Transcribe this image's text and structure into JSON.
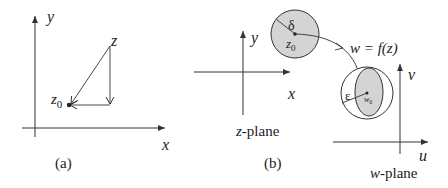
{
  "panel_a": {
    "caption": "(a)",
    "axis_x": "x",
    "axis_y": "y",
    "point_z": "z",
    "point_z0_main": "z",
    "point_z0_sub": "0"
  },
  "panel_b": {
    "caption": "(b)",
    "z_plane": {
      "axis_x": "x",
      "axis_y": "y",
      "label_var": "z",
      "label_suffix": "-plane",
      "delta": "δ",
      "center_main": "z",
      "center_sub": "0"
    },
    "mapping_label": "w = f(z)",
    "w_plane": {
      "axis_u": "u",
      "axis_v": "v",
      "label_var": "w",
      "label_suffix": "-plane",
      "epsilon": "ε",
      "center_main": "w",
      "center_sub": "0"
    }
  },
  "colors": {
    "stroke": "#333333",
    "fill_disk": "#d4d4d4",
    "background": "#ffffff"
  }
}
